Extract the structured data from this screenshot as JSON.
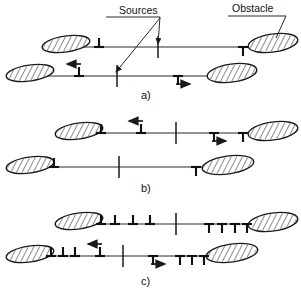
{
  "figure": {
    "title": "",
    "caption_labels": {
      "sources": "Sources",
      "obstacle": "Obstacle"
    },
    "panels": [
      {
        "id": "a",
        "label": "a)"
      },
      {
        "id": "b",
        "label": "b)"
      },
      {
        "id": "c",
        "label": "c)"
      }
    ]
  },
  "chart_data": {
    "type": "diagram",
    "subtitle": "",
    "xlabel": "",
    "ylabel": "",
    "annotations": [
      {
        "name": "sources-label",
        "text": "Sources",
        "x": 119,
        "y": 13
      },
      {
        "name": "obstacle-label",
        "text": "Obstacle",
        "x": 232,
        "y": 11
      },
      {
        "name": "panel-a-label",
        "text": "a)",
        "x": 141,
        "y": 99
      },
      {
        "name": "panel-b-label",
        "text": "b)",
        "x": 141,
        "y": 192
      },
      {
        "name": "panel-c-label",
        "text": "c)",
        "x": 141,
        "y": 285
      }
    ],
    "legend": {
      "position": "top",
      "entries": [
        {
          "symbol": "up-tack",
          "meaning": "edge dislocation, positive"
        },
        {
          "symbol": "down-tack",
          "meaning": "edge dislocation, negative"
        },
        {
          "symbol": "hatched-ellipse",
          "meaning": "obstacle"
        },
        {
          "symbol": "vertical-tick",
          "meaning": "source"
        }
      ]
    },
    "panels": [
      {
        "id": "a",
        "label": "a)",
        "lines": [
          {
            "name": "upper-slip-line",
            "y": 47,
            "x_start": 44,
            "x_end": 268,
            "source_x": 158,
            "obstacles": [
              {
                "name": "obstacle-left",
                "cx": 66,
                "cy": 44,
                "rx": 24,
                "ry": 8,
                "angle": -8
              },
              {
                "name": "obstacle-right",
                "cx": 273,
                "cy": 43,
                "rx": 25,
                "ry": 9,
                "angle": -8
              }
            ],
            "dislocations": [
              {
                "type": "up",
                "x": 99,
                "arrow": "none"
              },
              {
                "type": "down",
                "x": 243,
                "arrow": "none"
              }
            ]
          },
          {
            "name": "lower-slip-line",
            "y": 76,
            "x_start": 26,
            "x_end": 250,
            "source_x": 117,
            "obstacles": [
              {
                "name": "obstacle-left",
                "cx": 30,
                "cy": 73,
                "rx": 24,
                "ry": 8,
                "angle": -8
              },
              {
                "name": "obstacle-right",
                "cx": 232,
                "cy": 73,
                "rx": 25,
                "ry": 9,
                "angle": -8
              }
            ],
            "dislocations": [
              {
                "type": "up",
                "x": 79,
                "arrow": "left"
              },
              {
                "type": "down",
                "x": 178,
                "arrow": "right"
              }
            ]
          }
        ]
      },
      {
        "id": "b",
        "label": "b)",
        "lines": [
          {
            "name": "upper-slip-line",
            "y": 133,
            "x_start": 80,
            "x_end": 268,
            "source_x": 176,
            "obstacles": [
              {
                "name": "obstacle-left",
                "cx": 79,
                "cy": 131,
                "rx": 24,
                "ry": 8,
                "angle": -8
              },
              {
                "name": "obstacle-right",
                "cx": 273,
                "cy": 131,
                "rx": 25,
                "ry": 9,
                "angle": -8
              }
            ],
            "dislocations": [
              {
                "type": "up",
                "x": 101,
                "arrow": "none"
              },
              {
                "type": "up",
                "x": 141,
                "arrow": "left"
              },
              {
                "type": "down",
                "x": 214,
                "arrow": "right"
              },
              {
                "type": "down",
                "x": 243,
                "arrow": "none"
              }
            ]
          },
          {
            "name": "lower-slip-line",
            "y": 167,
            "x_start": 32,
            "x_end": 218,
            "source_x": 119,
            "obstacles": [
              {
                "name": "obstacle-left",
                "cx": 30,
                "cy": 165,
                "rx": 24,
                "ry": 8,
                "angle": -8
              },
              {
                "name": "obstacle-right",
                "cx": 228,
                "cy": 165,
                "rx": 26,
                "ry": 9,
                "angle": -8
              }
            ],
            "dislocations": [
              {
                "type": "up",
                "x": 54,
                "arrow": "none"
              },
              {
                "type": "down",
                "x": 196,
                "arrow": "none"
              }
            ]
          }
        ]
      },
      {
        "id": "c",
        "label": "c)",
        "lines": [
          {
            "name": "upper-slip-line",
            "y": 224,
            "x_start": 80,
            "x_end": 268,
            "source_x": 176,
            "obstacles": [
              {
                "name": "obstacle-left",
                "cx": 79,
                "cy": 221,
                "rx": 24,
                "ry": 8,
                "angle": -8
              },
              {
                "name": "obstacle-right",
                "cx": 273,
                "cy": 222,
                "rx": 25,
                "ry": 9,
                "angle": -8
              }
            ],
            "dislocations": [
              {
                "type": "up",
                "x": 101,
                "arrow": "none"
              },
              {
                "type": "up",
                "x": 115,
                "arrow": "none"
              },
              {
                "type": "up",
                "x": 133,
                "arrow": "none"
              },
              {
                "type": "up",
                "x": 150,
                "arrow": "none"
              },
              {
                "type": "down",
                "x": 209,
                "arrow": "none"
              },
              {
                "type": "down",
                "x": 222,
                "arrow": "none"
              },
              {
                "type": "down",
                "x": 235,
                "arrow": "none"
              },
              {
                "type": "down",
                "x": 247,
                "arrow": "none"
              }
            ]
          },
          {
            "name": "lower-slip-line",
            "y": 256,
            "x_start": 32,
            "x_end": 225,
            "source_x": 123,
            "obstacles": [
              {
                "name": "obstacle-left",
                "cx": 30,
                "cy": 254,
                "rx": 24,
                "ry": 8,
                "angle": -8
              },
              {
                "name": "obstacle-right",
                "cx": 232,
                "cy": 253,
                "rx": 26,
                "ry": 9,
                "angle": -8
              }
            ],
            "dislocations": [
              {
                "type": "up",
                "x": 51,
                "arrow": "none"
              },
              {
                "type": "up",
                "x": 63,
                "arrow": "none"
              },
              {
                "type": "up",
                "x": 75,
                "arrow": "none"
              },
              {
                "type": "up",
                "x": 100,
                "arrow": "left"
              },
              {
                "type": "down",
                "x": 153,
                "arrow": "right"
              },
              {
                "type": "down",
                "x": 180,
                "arrow": "none"
              },
              {
                "type": "down",
                "x": 192,
                "arrow": "none"
              },
              {
                "type": "down",
                "x": 204,
                "arrow": "none"
              }
            ]
          }
        ]
      }
    ],
    "leaders": [
      {
        "name": "sources-underline",
        "x1": 106,
        "y1": 17,
        "x2": 160,
        "y2": 17
      },
      {
        "name": "sources-leader-upper",
        "x1": 160,
        "y1": 17,
        "x2": 158,
        "y2": 44,
        "arrow": true
      },
      {
        "name": "sources-leader-lower",
        "x1": 160,
        "y1": 18,
        "x2": 116,
        "y2": 72,
        "arrow": true
      },
      {
        "name": "obstacle-underline",
        "x1": 228,
        "y1": 16,
        "x2": 286,
        "y2": 16
      },
      {
        "name": "obstacle-leader",
        "x1": 286,
        "y1": 16,
        "x2": 276,
        "y2": 38,
        "arrow": false
      }
    ]
  }
}
